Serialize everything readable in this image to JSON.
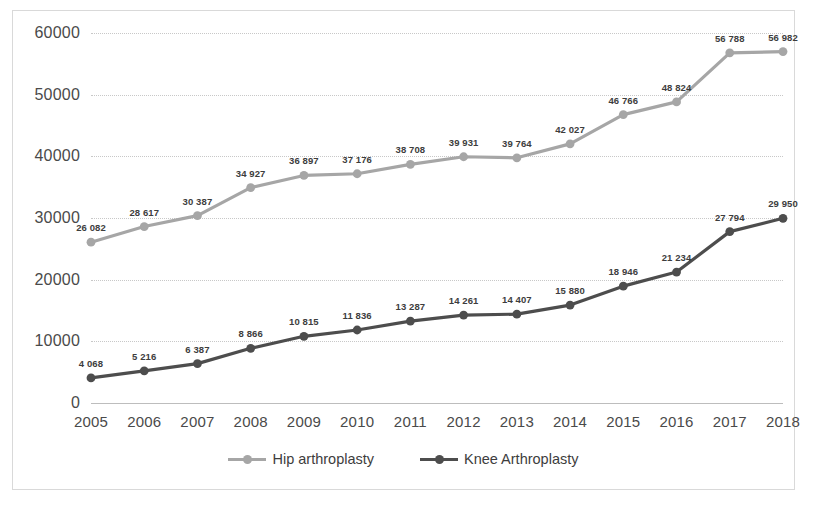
{
  "chart_data": {
    "type": "line",
    "title": "",
    "subtitle": "",
    "xlabel": "",
    "ylabel": "",
    "categories": [
      "2005",
      "2006",
      "2007",
      "2008",
      "2009",
      "2010",
      "2011",
      "2012",
      "2013",
      "2014",
      "2015",
      "2016",
      "2017",
      "2018"
    ],
    "ylim": [
      0,
      60000
    ],
    "yticks": [
      0,
      10000,
      20000,
      30000,
      40000,
      50000,
      60000
    ],
    "ytick_labels": [
      "0",
      "10000",
      "20000",
      "30000",
      "40000",
      "50000",
      "60000"
    ],
    "grid": true,
    "legend_position": "bottom",
    "series": [
      {
        "name": "Hip arthroplasty",
        "color": "#a6a6a6",
        "values": [
          26082,
          28617,
          30387,
          34927,
          36897,
          37176,
          38708,
          39931,
          39764,
          42027,
          46766,
          48824,
          56788,
          56982
        ],
        "data_labels": [
          "26 082",
          "28 617",
          "30 387",
          "34 927",
          "36 897",
          "37 176",
          "38 708",
          "39 931",
          "39 764",
          "42 027",
          "46 766",
          "48 824",
          "56 788",
          "56 982"
        ]
      },
      {
        "name": "Knee Arthroplasty",
        "color": "#4d4d4d",
        "values": [
          4068,
          5216,
          6387,
          8866,
          10815,
          11836,
          13287,
          14261,
          14407,
          15880,
          18946,
          21234,
          27794,
          29950
        ],
        "data_labels": [
          "4 068",
          "5 216",
          "6 387",
          "8 866",
          "10 815",
          "11 836",
          "13 287",
          "14 261",
          "14 407",
          "15 880",
          "18 946",
          "21 234",
          "27 794",
          "29 950"
        ]
      }
    ]
  },
  "legend": {
    "items": [
      {
        "label": "Hip arthroplasty",
        "color": "#a6a6a6"
      },
      {
        "label": "Knee Arthroplasty",
        "color": "#4d4d4d"
      }
    ]
  }
}
